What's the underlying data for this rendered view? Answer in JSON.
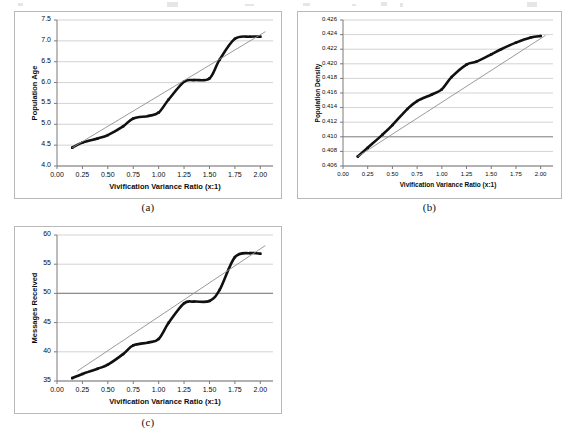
{
  "figure": {
    "panels": [
      {
        "caption": "(a)",
        "chart_data": {
          "type": "line",
          "title": "",
          "xlabel": "Vivification Variance Ratio (x:1)",
          "ylabel": "Population Age",
          "xlim": [
            0.0,
            2.125
          ],
          "ylim": [
            4.0,
            7.5
          ],
          "xticks": [
            "0.00",
            "0.25",
            "0.50",
            "0.75",
            "1.00",
            "1.25",
            "1.50",
            "1.75",
            "2.00"
          ],
          "xtick_values": [
            0.0,
            0.25,
            0.5,
            0.75,
            1.0,
            1.25,
            1.5,
            1.75,
            2.0
          ],
          "yticks": [
            "4.0",
            "4.5",
            "5.0",
            "5.5",
            "6.0",
            "6.5",
            "7.0",
            "7.5"
          ],
          "ytick_values": [
            4.0,
            4.5,
            5.0,
            5.5,
            6.0,
            6.5,
            7.0,
            7.5
          ],
          "grid": "horizontal",
          "legend": "none",
          "x": [
            0.15,
            0.25,
            0.4,
            0.5,
            0.65,
            0.75,
            0.9,
            1.0,
            1.1,
            1.25,
            1.35,
            1.5,
            1.6,
            1.75,
            1.9,
            2.0
          ],
          "series": [
            {
              "name": "Population Age",
              "style": "smooth-bold-black",
              "values": [
                4.44,
                4.56,
                4.66,
                4.74,
                4.95,
                5.14,
                5.2,
                5.28,
                5.6,
                6.02,
                6.06,
                6.1,
                6.55,
                7.05,
                7.1,
                7.1
              ]
            },
            {
              "name": "Linear trendline",
              "style": "thin-gray-straight",
              "x_endpoints": [
                0.15,
                2.05
              ],
              "y_endpoints": [
                4.44,
                7.22
              ]
            }
          ]
        }
      },
      {
        "caption": "(b)",
        "chart_data": {
          "type": "line",
          "title": "",
          "xlabel": "Vivification Variance Ratio (x:1)",
          "ylabel": "Population Density",
          "xlim": [
            0.0,
            2.125
          ],
          "ylim": [
            0.406,
            0.426
          ],
          "xticks": [
            "0.00",
            "0.25",
            "0.50",
            "0.75",
            "1.00",
            "1.25",
            "1.50",
            "1.75",
            "2.00"
          ],
          "xtick_values": [
            0.0,
            0.25,
            0.5,
            0.75,
            1.0,
            1.25,
            1.5,
            1.75,
            2.0
          ],
          "yticks": [
            "0.406",
            "0.408",
            "0.410",
            "0.412",
            "0.414",
            "0.416",
            "0.418",
            "0.420",
            "0.422",
            "0.424",
            "0.426"
          ],
          "ytick_values": [
            0.406,
            0.408,
            0.41,
            0.412,
            0.414,
            0.416,
            0.418,
            0.42,
            0.422,
            0.424,
            0.426
          ],
          "grid": "horizontal",
          "legend": "none",
          "x": [
            0.15,
            0.25,
            0.4,
            0.5,
            0.65,
            0.75,
            0.9,
            1.0,
            1.1,
            1.25,
            1.35,
            1.5,
            1.6,
            1.75,
            1.9,
            2.0
          ],
          "series": [
            {
              "name": "Population Density",
              "style": "smooth-bold-black",
              "values": [
                0.4073,
                0.4085,
                0.4103,
                0.4116,
                0.4138,
                0.4149,
                0.4158,
                0.4165,
                0.4182,
                0.4199,
                0.4203,
                0.4213,
                0.422,
                0.4229,
                0.4236,
                0.4238
              ]
            },
            {
              "name": "Linear trendline",
              "style": "thin-gray-straight",
              "x_endpoints": [
                0.15,
                2.05
              ],
              "y_endpoints": [
                0.4073,
                0.4239
              ]
            }
          ]
        }
      },
      {
        "caption": "(c)",
        "chart_data": {
          "type": "line",
          "title": "",
          "xlabel": "Vivification Variance Ratio (x:1)",
          "ylabel": "Messages Received",
          "xlim": [
            0.0,
            2.125
          ],
          "ylim": [
            35,
            60
          ],
          "xticks": [
            "0.00",
            "0.25",
            "0.50",
            "0.75",
            "1.00",
            "1.25",
            "1.50",
            "1.75",
            "2.00"
          ],
          "xtick_values": [
            0.0,
            0.25,
            0.5,
            0.75,
            1.0,
            1.25,
            1.5,
            1.75,
            2.0
          ],
          "yticks": [
            "35",
            "40",
            "45",
            "50",
            "55",
            "60"
          ],
          "ytick_values": [
            35,
            40,
            45,
            50,
            55,
            60
          ],
          "grid": "horizontal",
          "legend": "none",
          "x": [
            0.15,
            0.25,
            0.4,
            0.5,
            0.65,
            0.75,
            0.9,
            1.0,
            1.1,
            1.25,
            1.35,
            1.5,
            1.6,
            1.75,
            1.9,
            2.0
          ],
          "series": [
            {
              "name": "Messages Received",
              "style": "smooth-bold-black",
              "values": [
                35.5,
                36.2,
                37.1,
                37.8,
                39.6,
                41.1,
                41.6,
                42.2,
                45.0,
                48.3,
                48.6,
                48.7,
                50.6,
                56.2,
                56.9,
                56.8
              ]
            },
            {
              "name": "Linear trendline",
              "style": "thin-gray-straight",
              "x_endpoints": [
                0.2,
                2.05
              ],
              "y_endpoints": [
                36.7,
                58.2
              ]
            }
          ]
        }
      }
    ]
  },
  "colors": {
    "series_line": "#111111",
    "trendline": "#8f8f8f",
    "gridline": "#c8c8c8",
    "axis": "#7a7a7a",
    "frame": "#b9b9b9",
    "text": "#0a0a0a"
  }
}
